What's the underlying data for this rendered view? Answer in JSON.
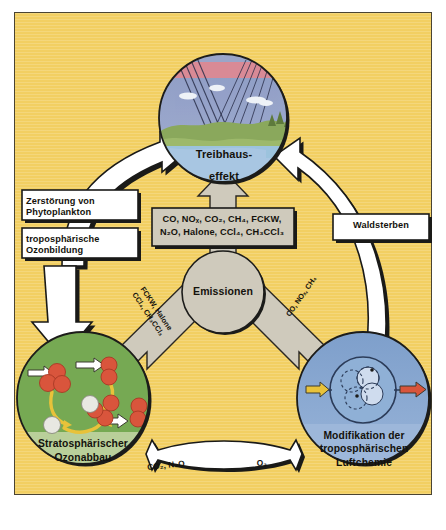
{
  "diagram": {
    "background_color": "#f2cf62",
    "nodes": {
      "greenhouse": {
        "label_line1": "Treibhaus-",
        "label_line2": "effekt",
        "illustration": "landscape-with-sky-and-radiation-rays",
        "fill_color": "#a8c6e2"
      },
      "emissions": {
        "label": "Emissionen",
        "fill_color": "#cfcabc"
      },
      "ozone": {
        "label_line1": "Stratosphärischer",
        "label_line2": "Ozonabbau",
        "illustration": "ozone-molecule-breakdown-cycle",
        "fill_color": "#76a953"
      },
      "troposphere": {
        "label_line1": "Modifikation der",
        "label_line2": "troposphärischen",
        "label_line3": "Luftchemie",
        "illustration": "photochemical-reaction-chamber",
        "fill_color": "#7e9fcb"
      }
    },
    "emission_box": {
      "line1": "CO, NOₓ, CO₂, CH₄, FCKW,",
      "line2": "N₂O, Halone, CCl₄, CH₃CCl₃"
    },
    "arrow_labels": {
      "phytoplankton": {
        "line1": "Zerstörung von",
        "line2": "Phytoplankton"
      },
      "tropospheric_ozone": {
        "line1": "troposphärische",
        "line2": "Ozonbildung"
      },
      "forest_dieback": "Waldsterben",
      "emissions_to_ozone": {
        "line1": "FCKW, Halone",
        "line2": "CCl₄, CH₃CCl₃"
      },
      "emissions_to_troposphere": "CO, NOₓ, CH₄",
      "ozone_to_troposphere": "CO₂, N₂O",
      "troposphere_to_ozone": "O₃"
    }
  }
}
